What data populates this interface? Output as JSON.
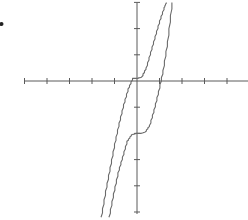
{
  "chart_data": {
    "type": "line",
    "title": "",
    "xlabel": "",
    "ylabel": "",
    "grid": false,
    "legend": null,
    "marker_label": "•",
    "axes": {
      "origin_px": [
        137,
        81
      ],
      "x_range_px": [
        24,
        248
      ],
      "y_range_px": [
        3,
        214
      ],
      "x_ticks": [
        -5,
        -4,
        -3,
        -2,
        -1,
        1,
        2,
        3,
        4
      ],
      "y_ticks": [
        3,
        2,
        1,
        -1,
        -2,
        -3,
        -4,
        -5
      ],
      "x_unit_px": 22.5,
      "y_unit_px": 26.2,
      "xlim": [
        -5,
        4.9
      ],
      "ylim": [
        -5.1,
        3
      ]
    },
    "series": [
      {
        "name": "upper-curve",
        "color": "#6a6a6a",
        "x": [
          -1.6,
          -1.4,
          -1.2,
          -1.0,
          -0.8,
          -0.6,
          -0.4,
          -0.2,
          0.0,
          0.2,
          0.4,
          0.6,
          0.8,
          1.0,
          1.2,
          1.3
        ],
        "y": [
          -5.2,
          -4.2,
          -3.3,
          -2.4,
          -1.6,
          -0.9,
          -0.3,
          0.1,
          0.1,
          0.15,
          0.5,
          1.1,
          1.7,
          2.3,
          2.8,
          3.0
        ]
      },
      {
        "name": "lower-curve",
        "color": "#6a6a6a",
        "x": [
          -1.25,
          -1.05,
          -0.85,
          -0.65,
          -0.45,
          -0.25,
          -0.05,
          0.15,
          0.35,
          0.55,
          0.75,
          0.95,
          1.15,
          1.35,
          1.55
        ],
        "y": [
          -5.2,
          -4.3,
          -3.5,
          -2.9,
          -2.3,
          -2.05,
          -2.0,
          -2.0,
          -1.95,
          -1.7,
          -1.1,
          -0.4,
          0.4,
          1.5,
          3.0
        ]
      }
    ]
  }
}
